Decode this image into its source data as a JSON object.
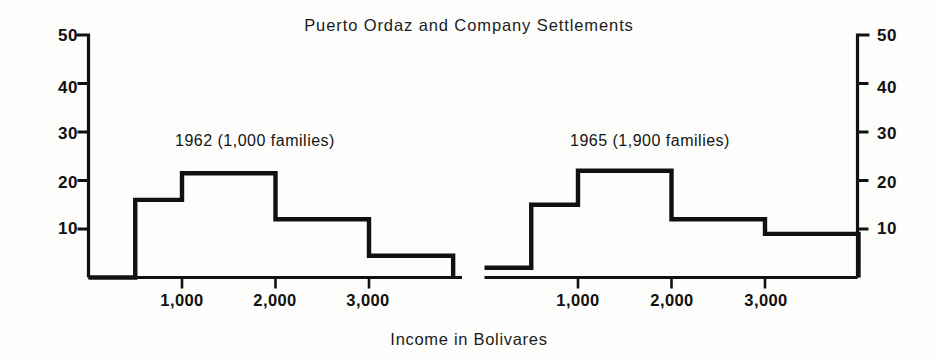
{
  "chart_data": {
    "type": "bar",
    "title": "Puerto Ordaz and Company Settlements",
    "xlabel": "Income in Bolivares",
    "ylabel": "",
    "grid": false,
    "legend": "none",
    "xlim": [
      0,
      4000
    ],
    "ylim": [
      0,
      50
    ],
    "yticks": [
      10,
      20,
      30,
      40,
      50
    ],
    "ytick_labels": [
      "10",
      "20",
      "30",
      "40",
      "50"
    ],
    "xticks": [
      1000,
      2000,
      3000
    ],
    "xtick_labels": [
      "1,000",
      "2,000",
      "3,000"
    ],
    "left_axis_labels": [
      "50",
      "40",
      "30",
      "20",
      "10"
    ],
    "right_axis_labels": [
      "50",
      "40",
      "30",
      "20",
      "10"
    ],
    "panels": [
      {
        "name": "panel-1962",
        "label": "1962 (1,000 families)",
        "bin_edges": [
          0,
          500,
          1000,
          2000,
          3000,
          3900
        ],
        "values": [
          0,
          16,
          21.5,
          12,
          4.5
        ]
      },
      {
        "name": "panel-1965",
        "label": "1965 (1,900 families)",
        "bin_edges": [
          0,
          500,
          1000,
          2000,
          3000,
          4000
        ],
        "values": [
          2,
          15,
          22,
          12,
          9
        ]
      }
    ]
  },
  "figure": {
    "title": "Puerto Ordaz and Company Settlements",
    "xlabel": "Income in Bolivares",
    "panel_left_label": "1962 (1,000 families)",
    "panel_right_label": "1965 (1,900 families)",
    "y_50": "50",
    "y_40": "40",
    "y_30": "30",
    "y_20": "20",
    "y_10": "10",
    "x_1000": "1,000",
    "x_2000": "2,000",
    "x_3000": "3,000",
    "line_color": "#111111",
    "background_color": "#fdfdfb"
  }
}
